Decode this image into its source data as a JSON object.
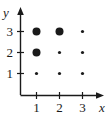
{
  "figure": {
    "title": "",
    "background_color": "#ffffff",
    "ink_color": "#1a1a1a"
  },
  "axes": {
    "x_axis_label": "x",
    "y_axis_label": "y",
    "x_tick_labels": [
      "1",
      "2",
      "3"
    ],
    "y_tick_labels": [
      "1",
      "2",
      "3"
    ],
    "x_axis_has_arrow": true,
    "y_axis_has_arrow": true
  },
  "chart_data": {
    "type": "scatter",
    "title": "",
    "xlabel": "x",
    "ylabel": "y",
    "xlim": [
      0,
      3.8
    ],
    "ylim": [
      0,
      3.6
    ],
    "grid": false,
    "legend": "none",
    "xticks": [
      1,
      2,
      3
    ],
    "yticks": [
      1,
      2,
      3
    ],
    "xticklabels": [
      "1",
      "2",
      "3"
    ],
    "yticklabels": [
      "1",
      "2",
      "3"
    ],
    "marker_color": "#1a1a1a",
    "marker_shape": "filled-circle",
    "points": [
      {
        "x": 1,
        "y": 3,
        "size": "large",
        "radius_px": 4.0
      },
      {
        "x": 2,
        "y": 3,
        "size": "large",
        "radius_px": 4.0
      },
      {
        "x": 3,
        "y": 3,
        "size": "small",
        "radius_px": 1.6
      },
      {
        "x": 1,
        "y": 2,
        "size": "large",
        "radius_px": 4.0
      },
      {
        "x": 2,
        "y": 2,
        "size": "small",
        "radius_px": 1.6
      },
      {
        "x": 3,
        "y": 2,
        "size": "small",
        "radius_px": 1.6
      },
      {
        "x": 1,
        "y": 1,
        "size": "small",
        "radius_px": 1.6
      },
      {
        "x": 2,
        "y": 1,
        "size": "small",
        "radius_px": 1.6
      },
      {
        "x": 3,
        "y": 1,
        "size": "small",
        "radius_px": 1.6
      }
    ]
  }
}
